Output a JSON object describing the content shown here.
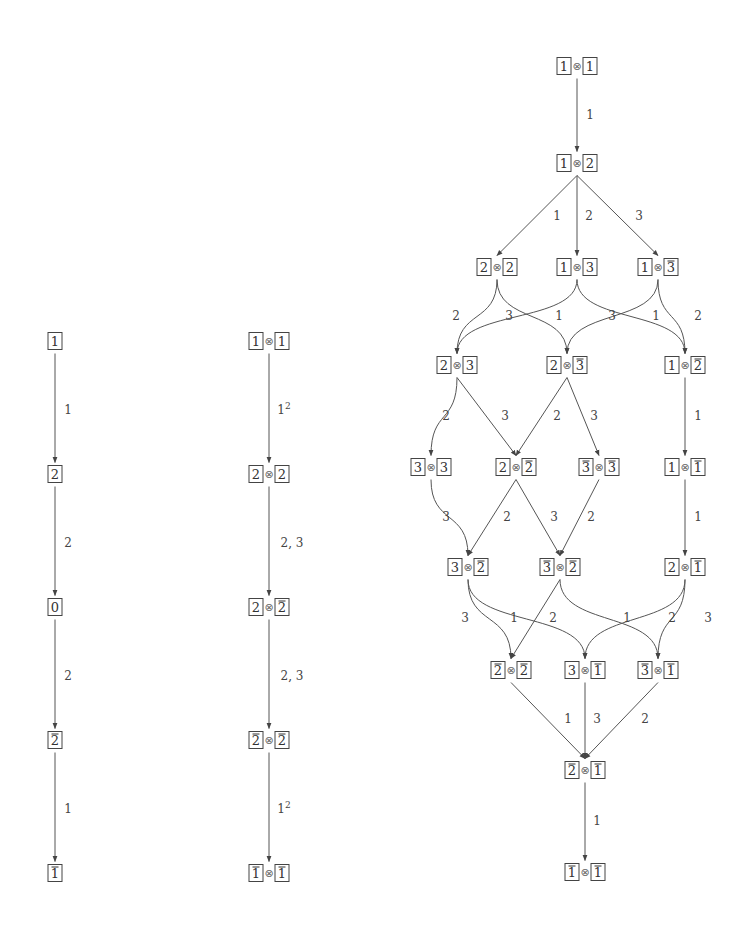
{
  "diagrams": [
    {
      "name": "crystal-B1",
      "nodes": [
        {
          "id": "a1",
          "x": 55,
          "y": 341,
          "tensor": [
            {
              "v": "1",
              "bar": false
            }
          ]
        },
        {
          "id": "a2",
          "x": 55,
          "y": 474,
          "tensor": [
            {
              "v": "2",
              "bar": false
            }
          ]
        },
        {
          "id": "a0",
          "x": 55,
          "y": 607,
          "tensor": [
            {
              "v": "0",
              "bar": false
            }
          ]
        },
        {
          "id": "a2b",
          "x": 55,
          "y": 740,
          "tensor": [
            {
              "v": "2",
              "bar": true
            }
          ]
        },
        {
          "id": "a1b",
          "x": 55,
          "y": 873,
          "tensor": [
            {
              "v": "1",
              "bar": true
            }
          ]
        }
      ],
      "edges": [
        {
          "from": "a1",
          "to": "a2",
          "label": "1",
          "lx": 68,
          "ly": 410
        },
        {
          "from": "a2",
          "to": "a0",
          "label": "2",
          "lx": 68,
          "ly": 543
        },
        {
          "from": "a0",
          "to": "a2b",
          "label": "2",
          "lx": 68,
          "ly": 676
        },
        {
          "from": "a2b",
          "to": "a1b",
          "label": "1",
          "lx": 68,
          "ly": 809
        }
      ]
    },
    {
      "name": "crystal-B1-tensor-square-highest",
      "nodes": [
        {
          "id": "b11",
          "x": 269,
          "y": 341,
          "tensor": [
            {
              "v": "1",
              "bar": false
            },
            {
              "v": "1",
              "bar": false
            }
          ]
        },
        {
          "id": "b22",
          "x": 269,
          "y": 474,
          "tensor": [
            {
              "v": "2",
              "bar": false
            },
            {
              "v": "2",
              "bar": false
            }
          ]
        },
        {
          "id": "b22b",
          "x": 269,
          "y": 607,
          "tensor": [
            {
              "v": "2",
              "bar": false
            },
            {
              "v": "2",
              "bar": true
            }
          ]
        },
        {
          "id": "b2b2b",
          "x": 269,
          "y": 740,
          "tensor": [
            {
              "v": "2",
              "bar": true
            },
            {
              "v": "2",
              "bar": true
            }
          ]
        },
        {
          "id": "b1b1b",
          "x": 269,
          "y": 873,
          "tensor": [
            {
              "v": "1",
              "bar": true
            },
            {
              "v": "1",
              "bar": true
            }
          ]
        }
      ],
      "edges": [
        {
          "from": "b11",
          "to": "b22",
          "label": "1",
          "sup": "2",
          "lx": 284,
          "ly": 410
        },
        {
          "from": "b22",
          "to": "b22b",
          "label": "2, 3",
          "lx": 292,
          "ly": 543
        },
        {
          "from": "b22b",
          "to": "b2b2b",
          "label": "2, 3",
          "lx": 292,
          "ly": 676
        },
        {
          "from": "b2b2b",
          "to": "b1b1b",
          "label": "1",
          "sup": "2",
          "lx": 284,
          "ly": 809
        }
      ]
    },
    {
      "name": "crystal-B3-tensor-square",
      "nodes": [
        {
          "id": "c11",
          "x": 577,
          "y": 66,
          "tensor": [
            {
              "v": "1",
              "bar": false
            },
            {
              "v": "1",
              "bar": false
            }
          ]
        },
        {
          "id": "c12",
          "x": 577,
          "y": 163,
          "tensor": [
            {
              "v": "1",
              "bar": false
            },
            {
              "v": "2",
              "bar": false
            }
          ]
        },
        {
          "id": "c22",
          "x": 497,
          "y": 267,
          "tensor": [
            {
              "v": "2",
              "bar": false
            },
            {
              "v": "2",
              "bar": false
            }
          ]
        },
        {
          "id": "c13",
          "x": 577,
          "y": 267,
          "tensor": [
            {
              "v": "1",
              "bar": false
            },
            {
              "v": "3",
              "bar": false
            }
          ]
        },
        {
          "id": "c13b",
          "x": 658,
          "y": 267,
          "tensor": [
            {
              "v": "1",
              "bar": false
            },
            {
              "v": "3",
              "bar": true
            }
          ]
        },
        {
          "id": "c23",
          "x": 457,
          "y": 365,
          "tensor": [
            {
              "v": "2",
              "bar": false
            },
            {
              "v": "3",
              "bar": false
            }
          ]
        },
        {
          "id": "c23b",
          "x": 567,
          "y": 365,
          "tensor": [
            {
              "v": "2",
              "bar": false
            },
            {
              "v": "3",
              "bar": true
            }
          ]
        },
        {
          "id": "c12b",
          "x": 685,
          "y": 365,
          "tensor": [
            {
              "v": "1",
              "bar": false
            },
            {
              "v": "2",
              "bar": true
            }
          ]
        },
        {
          "id": "c33",
          "x": 431,
          "y": 467,
          "tensor": [
            {
              "v": "3",
              "bar": false
            },
            {
              "v": "3",
              "bar": false
            }
          ]
        },
        {
          "id": "c22b",
          "x": 516,
          "y": 467,
          "tensor": [
            {
              "v": "2",
              "bar": false
            },
            {
              "v": "2",
              "bar": true
            }
          ]
        },
        {
          "id": "c3b3b",
          "x": 599,
          "y": 467,
          "tensor": [
            {
              "v": "3",
              "bar": true
            },
            {
              "v": "3",
              "bar": true
            }
          ]
        },
        {
          "id": "c11b",
          "x": 685,
          "y": 467,
          "tensor": [
            {
              "v": "1",
              "bar": false
            },
            {
              "v": "1",
              "bar": true
            }
          ]
        },
        {
          "id": "c32b",
          "x": 468,
          "y": 567,
          "tensor": [
            {
              "v": "3",
              "bar": false
            },
            {
              "v": "2",
              "bar": true
            }
          ]
        },
        {
          "id": "c3b2b",
          "x": 560,
          "y": 567,
          "tensor": [
            {
              "v": "3",
              "bar": true
            },
            {
              "v": "2",
              "bar": true
            }
          ]
        },
        {
          "id": "c21b",
          "x": 685,
          "y": 567,
          "tensor": [
            {
              "v": "2",
              "bar": false
            },
            {
              "v": "1",
              "bar": true
            }
          ]
        },
        {
          "id": "c2b2b",
          "x": 511,
          "y": 670,
          "tensor": [
            {
              "v": "2",
              "bar": true
            },
            {
              "v": "2",
              "bar": true
            }
          ]
        },
        {
          "id": "c31b",
          "x": 585,
          "y": 670,
          "tensor": [
            {
              "v": "3",
              "bar": false
            },
            {
              "v": "1",
              "bar": true
            }
          ]
        },
        {
          "id": "c3b1b",
          "x": 658,
          "y": 670,
          "tensor": [
            {
              "v": "3",
              "bar": true
            },
            {
              "v": "1",
              "bar": true
            }
          ]
        },
        {
          "id": "c2b1b",
          "x": 585,
          "y": 770,
          "tensor": [
            {
              "v": "2",
              "bar": true
            },
            {
              "v": "1",
              "bar": true
            }
          ]
        },
        {
          "id": "c1b1b",
          "x": 585,
          "y": 872,
          "tensor": [
            {
              "v": "1",
              "bar": true
            },
            {
              "v": "1",
              "bar": true
            }
          ]
        }
      ],
      "edges": [
        {
          "from": "c11",
          "to": "c12",
          "label": "1",
          "lx": 590,
          "ly": 115,
          "curve": 0
        },
        {
          "from": "c12",
          "to": "c22",
          "label": "1",
          "lx": 557,
          "ly": 216,
          "curve": 0
        },
        {
          "from": "c12",
          "to": "c13",
          "label": "2",
          "lx": 589,
          "ly": 216,
          "curve": 0
        },
        {
          "from": "c12",
          "to": "c13b",
          "label": "3",
          "lx": 639,
          "ly": 216,
          "curve": 0
        },
        {
          "from": "c22",
          "to": "c23",
          "label": "2",
          "lx": 456,
          "ly": 316,
          "curve": -1
        },
        {
          "from": "c22",
          "to": "c23b",
          "label": "3",
          "lx": 509,
          "ly": 316,
          "curve": 1
        },
        {
          "from": "c13",
          "to": "c23",
          "label": "1",
          "lx": 559,
          "ly": 316,
          "curve": -1
        },
        {
          "from": "c13",
          "to": "c12b",
          "label": "3",
          "lx": 612,
          "ly": 316,
          "curve": 1
        },
        {
          "from": "c13b",
          "to": "c23b",
          "label": "1",
          "lx": 656,
          "ly": 316,
          "curve": -1
        },
        {
          "from": "c13b",
          "to": "c12b",
          "label": "2",
          "lx": 698,
          "ly": 316,
          "curve": 1
        },
        {
          "from": "c23",
          "to": "c33",
          "label": "2",
          "lx": 446,
          "ly": 416,
          "curve": -1
        },
        {
          "from": "c23",
          "to": "c22b",
          "label": "3",
          "lx": 505,
          "ly": 416,
          "curve": 0
        },
        {
          "from": "c23b",
          "to": "c22b",
          "label": "2",
          "lx": 557,
          "ly": 416,
          "curve": 0
        },
        {
          "from": "c23b",
          "to": "c3b3b",
          "label": "3",
          "lx": 594,
          "ly": 416,
          "curve": 0
        },
        {
          "from": "c12b",
          "to": "c11b",
          "label": "1",
          "lx": 698,
          "ly": 416,
          "curve": 0
        },
        {
          "from": "c33",
          "to": "c32b",
          "label": "3",
          "lx": 446,
          "ly": 517,
          "curve": 1
        },
        {
          "from": "c22b",
          "to": "c32b",
          "label": "2",
          "lx": 507,
          "ly": 517,
          "curve": 0
        },
        {
          "from": "c22b",
          "to": "c3b2b",
          "label": "3",
          "lx": 554,
          "ly": 517,
          "curve": 0
        },
        {
          "from": "c3b3b",
          "to": "c3b2b",
          "label": "2",
          "lx": 591,
          "ly": 517,
          "curve": 0
        },
        {
          "from": "c11b",
          "to": "c21b",
          "label": "1",
          "lx": 698,
          "ly": 517,
          "curve": 0
        },
        {
          "from": "c32b",
          "to": "c2b2b",
          "label": "3",
          "lx": 465,
          "ly": 618,
          "curve": 1
        },
        {
          "from": "c32b",
          "to": "c31b",
          "label": "1",
          "lx": 514,
          "ly": 618,
          "curve": 1
        },
        {
          "from": "c3b2b",
          "to": "c2b2b",
          "label": "2",
          "lx": 553,
          "ly": 618,
          "curve": 0
        },
        {
          "from": "c3b2b",
          "to": "c3b1b",
          "label": "1",
          "lx": 627,
          "ly": 618,
          "curve": 1
        },
        {
          "from": "c21b",
          "to": "c31b",
          "label": "2",
          "lx": 672,
          "ly": 618,
          "curve": -1
        },
        {
          "from": "c21b",
          "to": "c3b1b",
          "label": "3",
          "lx": 708,
          "ly": 618,
          "curve": 1
        },
        {
          "from": "c2b2b",
          "to": "c2b1b",
          "label": "1",
          "lx": 568,
          "ly": 719,
          "curve": 0
        },
        {
          "from": "c31b",
          "to": "c2b1b",
          "label": "3",
          "lx": 597,
          "ly": 719,
          "curve": 0
        },
        {
          "from": "c3b1b",
          "to": "c2b1b",
          "label": "2",
          "lx": 645,
          "ly": 719,
          "curve": 0
        },
        {
          "from": "c2b1b",
          "to": "c1b1b",
          "label": "1",
          "lx": 597,
          "ly": 821,
          "curve": 0
        }
      ]
    }
  ],
  "symbols": {
    "tensor": "⊗"
  }
}
